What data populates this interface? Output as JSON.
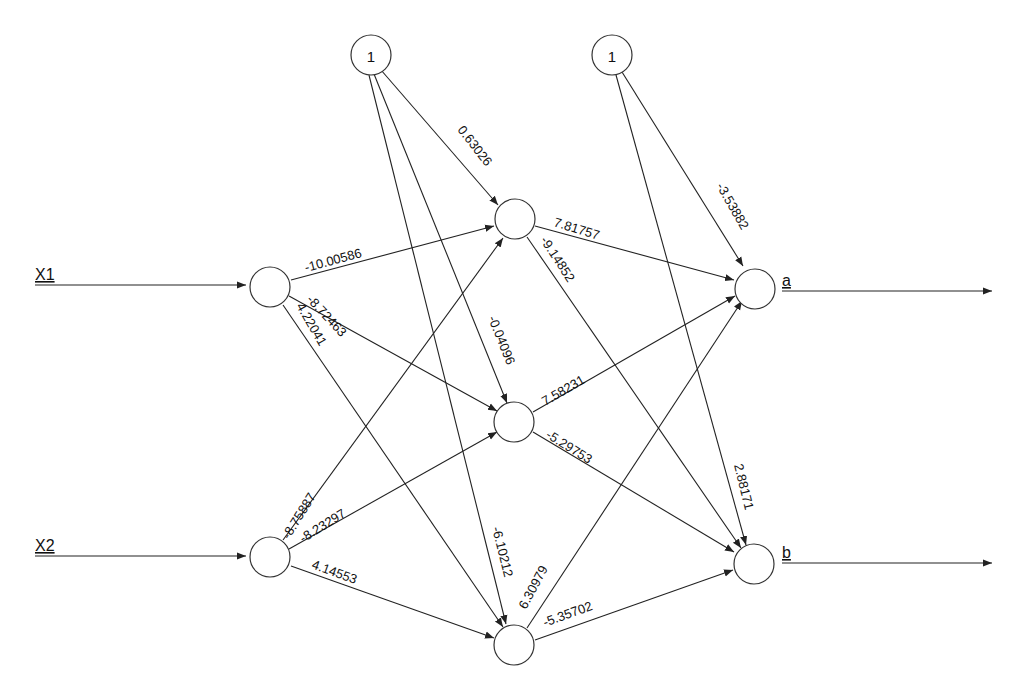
{
  "diagram": {
    "type": "neural-network",
    "nodes": {
      "x1": {
        "label": "X1",
        "x": 271,
        "y": 287
      },
      "x2": {
        "label": "X2",
        "x": 271,
        "y": 557
      },
      "bias1": {
        "label": "1",
        "x": 370,
        "y": 55
      },
      "bias2": {
        "label": "1",
        "x": 612,
        "y": 55
      },
      "h1": {
        "label": "",
        "x": 515,
        "y": 220
      },
      "h2": {
        "label": "",
        "x": 515,
        "y": 422
      },
      "h3": {
        "label": "",
        "x": 515,
        "y": 645
      },
      "a": {
        "label": "a",
        "x": 755,
        "y": 285
      },
      "b": {
        "label": "b",
        "x": 755,
        "y": 565
      }
    },
    "inputs": {
      "x1_label": "X1",
      "x2_label": "X2"
    },
    "outputs": {
      "a_label": "a",
      "b_label": "b"
    },
    "bias_labels": {
      "bias1": "1",
      "bias2": "1"
    },
    "weights": {
      "bias1_h1": "0.63026",
      "bias1_h2": "-0.04096",
      "bias1_h3": "-6.10212",
      "x1_h1": "-10.00586",
      "x1_h2": "-8.72463",
      "x1_h3": "4.22041",
      "x2_h1": "-8.75887",
      "x2_h2": "-8.23297",
      "x2_h3": "4.14553",
      "bias2_a": "-3.53882",
      "bias2_b": "2.88171",
      "h1_a": "7.81757",
      "h1_b": "-9.14852",
      "h2_a": "7.58231",
      "h2_b": "-5.29753",
      "h3_a": "6.30979",
      "h3_b": "-5.35702"
    }
  }
}
